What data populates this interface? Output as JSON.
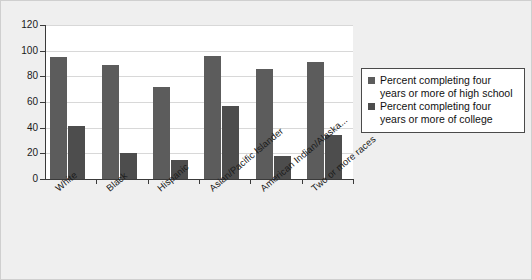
{
  "chart_data": {
    "type": "bar",
    "title": "",
    "xlabel": "",
    "ylabel": "",
    "ylim": [
      0,
      120
    ],
    "ytick_step": 20,
    "yticks": [
      120,
      100,
      80,
      60,
      40,
      20,
      0
    ],
    "grid": true,
    "legend_position": "right",
    "categories": [
      "White",
      "Black",
      "Hispanic",
      "Asian/Pacific Islander",
      "American Indian/Alaska...",
      "Two or more races"
    ],
    "series": [
      {
        "name": "Percent completing four years or more of high school",
        "color": "#5c5c5c",
        "values": [
          95,
          89,
          72,
          96,
          86,
          91
        ]
      },
      {
        "name": "Percent completing four years or more of college",
        "color": "#4d4d4d",
        "values": [
          41,
          20,
          15,
          57,
          18,
          34
        ]
      }
    ]
  },
  "legend": {
    "items": [
      {
        "line1": "Percent completing four",
        "line2": "years or more of high school"
      },
      {
        "line1": "Percent completing four",
        "line2": "years or more of college"
      }
    ]
  }
}
